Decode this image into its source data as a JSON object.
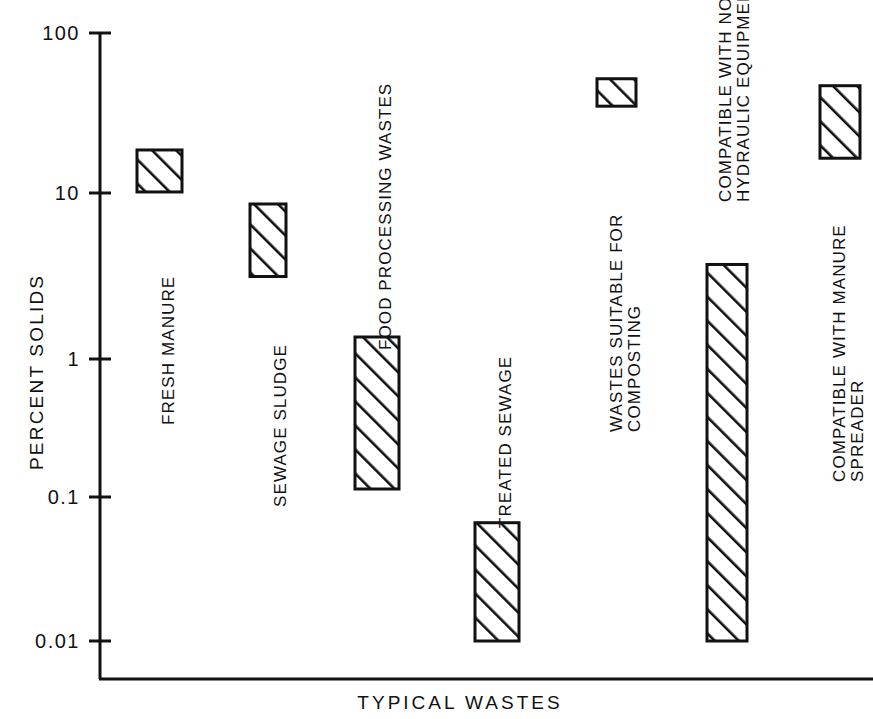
{
  "chart_data": {
    "type": "bar",
    "title": "",
    "subtitle": "",
    "xlabel": "TYPICAL  WASTES",
    "ylabel": "PERCENT  SOLIDS",
    "yscale": "log",
    "ylim": [
      0.01,
      100
    ],
    "ytick_labels": [
      "100",
      "10",
      "1",
      "0.1",
      "0.01"
    ],
    "ytick_values": [
      100,
      10,
      1,
      0.1,
      0.01
    ],
    "grid": false,
    "legend": null,
    "bar_style": "diagonal-hatch-outlined",
    "note": "Floating range bars: each bar spans a low-to-high percent solids range on a log axis.",
    "categories": [
      "FRESH MANURE",
      "SEWAGE SLUDGE",
      "FOOD PROCESSING WASTES",
      "TREATED SEWAGE",
      "WASTES SUITABLE FOR COMPOSTING",
      "COMPATIBLE WITH NORMAL HYDRAULIC EQUIPMENT",
      "COMPATIBLE WITH MANURE SPREADER"
    ],
    "bars": [
      {
        "label": "FRESH MANURE",
        "label_lines": [
          "FRESH MANURE"
        ],
        "low": 9,
        "high": 17,
        "x_px": 137,
        "w_px": 45,
        "label_x_px": 160,
        "label_y_px": 425
      },
      {
        "label": "SEWAGE SLUDGE",
        "label_lines": [
          "SEWAGE SLUDGE"
        ],
        "low": 2.5,
        "high": 7.5,
        "x_px": 250,
        "w_px": 36,
        "label_x_px": 272,
        "label_y_px": 507
      },
      {
        "label": "FOOD PROCESSING WASTES",
        "label_lines": [
          "FOOD PROCESSING WASTES"
        ],
        "low": 0.1,
        "high": 1,
        "x_px": 355,
        "w_px": 44,
        "label_x_px": 377,
        "label_y_px": 350
      },
      {
        "label": "TREATED SEWAGE",
        "label_lines": [
          "TREATED SEWAGE"
        ],
        "low": 0.01,
        "high": 0.06,
        "x_px": 475,
        "w_px": 44,
        "label_x_px": 497,
        "label_y_px": 528
      },
      {
        "label": "WASTES SUITABLE FOR COMPOSTING",
        "label_lines": [
          "WASTES SUITABLE FOR",
          "COMPOSTING"
        ],
        "low": 33,
        "high": 50,
        "x_px": 597,
        "w_px": 39,
        "label_x_px": 608,
        "label_y_px": 432
      },
      {
        "label": "COMPATIBLE WITH NORMAL HYDRAULIC EQUIPMENT",
        "label_lines": [
          "COMPATIBLE WITH NORMAL",
          "HYDRAULIC EQUIPMENT"
        ],
        "low": 0.01,
        "high": 3,
        "x_px": 707,
        "w_px": 40,
        "label_x_px": 717,
        "label_y_px": 202
      },
      {
        "label": "COMPATIBLE WITH MANURE SPREADER",
        "label_lines": [
          "COMPATIBLE WITH MANURE",
          "SPREADER"
        ],
        "low": 15,
        "high": 45,
        "x_px": 820,
        "w_px": 40,
        "label_x_px": 831,
        "label_y_px": 482
      }
    ]
  },
  "colors": {
    "ink": "#111111",
    "background": "#ffffff",
    "hatch": "#111111"
  },
  "axes": {
    "y_axis_x_px": 100,
    "baseline_y_px": 679,
    "plot_right_px": 873,
    "tick_len_px": 22,
    "tick_y_px": [
      33,
      193,
      359,
      497,
      641
    ]
  }
}
